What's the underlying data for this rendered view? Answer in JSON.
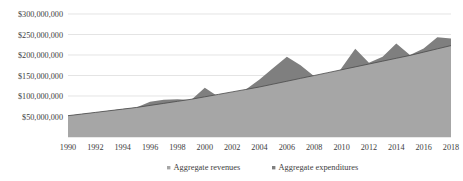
{
  "chart_data": {
    "type": "area",
    "title": "",
    "subtitle": "",
    "xlabel": "",
    "ylabel": "",
    "grid": true,
    "legend_position": "bottom",
    "xlim": [
      1990,
      2018
    ],
    "ylim": [
      0,
      300000000
    ],
    "ytick_values": [
      50000000,
      100000000,
      150000000,
      200000000,
      250000000,
      300000000
    ],
    "ytick_labels": [
      "$50,000,000",
      "$100,000,000",
      "$150,000,000",
      "$200,000,000",
      "$250,000,000",
      "$300,000,000"
    ],
    "xtick_values": [
      1990,
      1992,
      1994,
      1996,
      1998,
      2000,
      2002,
      2004,
      2006,
      2008,
      2010,
      2012,
      2014,
      2016,
      2018
    ],
    "xtick_labels": [
      "1990",
      "1992",
      "1994",
      "1996",
      "1998",
      "2000",
      "2002",
      "2004",
      "2006",
      "2008",
      "2010",
      "2012",
      "2014",
      "2016",
      "2018"
    ],
    "x": [
      1990,
      1991,
      1992,
      1993,
      1994,
      1995,
      1996,
      1997,
      1998,
      1999,
      2000,
      2001,
      2002,
      2003,
      2004,
      2005,
      2006,
      2007,
      2008,
      2009,
      2010,
      2011,
      2012,
      2013,
      2014,
      2015,
      2016,
      2017,
      2018
    ],
    "series": [
      {
        "name": "Aggregate revenues",
        "color": "#a6a6a6",
        "values": [
          52000000,
          56000000,
          60000000,
          64000000,
          68000000,
          72000000,
          77000000,
          82000000,
          87000000,
          92000000,
          98000000,
          104000000,
          110000000,
          116000000,
          122000000,
          129000000,
          136000000,
          143000000,
          150000000,
          157000000,
          164000000,
          171000000,
          178000000,
          185000000,
          192000000,
          199000000,
          207000000,
          215000000,
          223000000
        ]
      },
      {
        "name": "Aggregate expenditures",
        "color": "#7f7f7f",
        "values": [
          52000000,
          56000000,
          60000000,
          64000000,
          68000000,
          72000000,
          86000000,
          91000000,
          92000000,
          90000000,
          120000000,
          98000000,
          94000000,
          116000000,
          140000000,
          168000000,
          196000000,
          175000000,
          148000000,
          120000000,
          168000000,
          215000000,
          181000000,
          196000000,
          228000000,
          200000000,
          216000000,
          243000000,
          240000000
        ]
      }
    ],
    "legend": [
      {
        "label": "Aggregate revenues",
        "color": "#a6a6a6"
      },
      {
        "label": "Aggregate expenditures",
        "color": "#7f7f7f"
      }
    ]
  },
  "layout": {
    "plot_left": 68,
    "plot_right": 451,
    "plot_top": 14,
    "plot_bottom": 137,
    "xlabel_y": 150,
    "legend_y": 170,
    "legend_entry_x": [
      167,
      272
    ]
  }
}
